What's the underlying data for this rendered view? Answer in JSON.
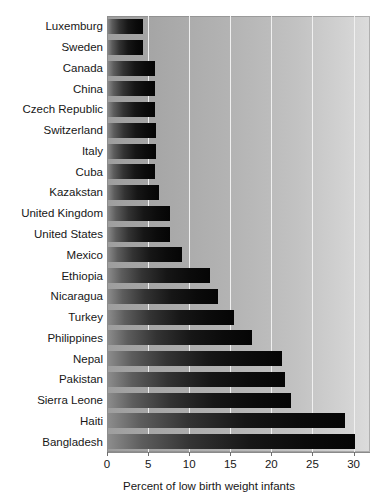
{
  "chart_data": {
    "type": "bar",
    "orientation": "horizontal",
    "title": "",
    "xlabel": "Percent of low birth weight infants",
    "ylabel": "",
    "xlim": [
      0,
      32
    ],
    "xticks": [
      0,
      5,
      10,
      15,
      20,
      25,
      30
    ],
    "xticklabels": [
      "0",
      "5",
      "10",
      "15",
      "20",
      "25",
      "30"
    ],
    "grid": "vertical gridlines at x ticks, white",
    "legend": "none",
    "categories": [
      "Luxemburg",
      "Sweden",
      "Canada",
      "China",
      "Czech Republic",
      "Switzerland",
      "Italy",
      "Cuba",
      "Kazakstan",
      "United Kingdom",
      "United States",
      "Mexico",
      "Ethiopia",
      "Nicaragua",
      "Turkey",
      "Philippines",
      "Nepal",
      "Pakistan",
      "Sierra Leone",
      "Haiti",
      "Bangladesh"
    ],
    "values": [
      4.4,
      4.4,
      5.8,
      5.8,
      5.8,
      6.0,
      6.0,
      5.9,
      6.3,
      7.7,
      7.7,
      9.1,
      12.5,
      13.5,
      15.4,
      17.6,
      21.3,
      21.7,
      22.4,
      28.9,
      30.2
    ],
    "colors": {
      "bar_gradient_start": "#8e8e8e",
      "bar_gradient_end": "#050505",
      "plot_background_left": "#9e9e9e",
      "plot_background_right": "#dcdcdc",
      "gridline": "#f0f0f0",
      "axis": "#8a8a8a",
      "text": "#171717"
    }
  }
}
